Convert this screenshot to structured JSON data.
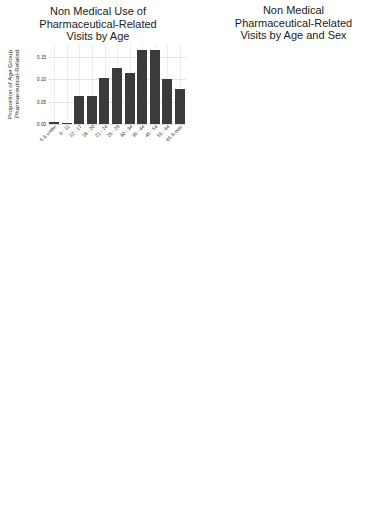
{
  "figure": {
    "age_categories": [
      "5 & under",
      "6 - 11",
      "12 - 17",
      "18 - 20",
      "21 - 24",
      "25 - 29",
      "30 - 34",
      "35 - 44",
      "45 - 54",
      "55 - 64",
      "65 & over"
    ],
    "xlabel": "age",
    "legend": {
      "title": "sex",
      "male": "male",
      "female": "female"
    }
  },
  "chart_data": [
    {
      "type": "bar",
      "panel": "top-left",
      "title": "Non Medical Use of Pharmaceutical-Related Visits by Age",
      "title_lines": [
        "Non Medical Use of",
        "Pharmaceutical-Related",
        "Visits by Age"
      ],
      "ylabel": "Proportion of Age Group Pharmaceutical-Related",
      "ylabel_lines": [
        "Proportion of Age Group",
        "Pharmaceutical-Related"
      ],
      "xlabel": "",
      "categories": [
        "5 & under",
        "6 - 11",
        "12 - 17",
        "18 - 20",
        "21 - 24",
        "25 - 29",
        "30 - 34",
        "35 - 44",
        "45 - 54",
        "55 - 64",
        "65 & over"
      ],
      "values": [
        0.005,
        0.002,
        0.063,
        0.063,
        0.103,
        0.124,
        0.113,
        0.165,
        0.165,
        0.1,
        0.078
      ],
      "yticks": [
        0.0,
        0.05,
        0.1,
        0.15
      ],
      "yticklabels": [
        "0.00",
        "0.05",
        "0.10",
        "0.15"
      ],
      "ylim": [
        0,
        0.178
      ],
      "grid": true
    },
    {
      "type": "line",
      "panel": "top-right",
      "title": "Non Medical Pharmaceutical-Related Visits by Age and Sex",
      "title_lines": [
        "Non Medical",
        "Pharmaceutical-Related",
        "Visits by Age and Sex"
      ],
      "ylabel": "Proportion of Sex Pharmaceutical-Related",
      "ylabel_lines": [
        "Proportion of Sex",
        "Pharmaceutical-Related"
      ],
      "xlabel": "age",
      "x": [
        "5 & under",
        "6 - 11",
        "12 - 17",
        "18 - 20",
        "21 - 24",
        "25 - 29",
        "30 - 34",
        "35 - 44",
        "45 - 54",
        "55 - 64",
        "65 & over"
      ],
      "series": [
        {
          "name": "male",
          "values": [
            0.0075,
            0.0062,
            0.03,
            0.036,
            0.044,
            0.062,
            0.053,
            0.076,
            0.077,
            0.052,
            0.044
          ]
        },
        {
          "name": "female",
          "values": [
            0.0075,
            0.0062,
            0.033,
            0.0268,
            0.04,
            0.048,
            0.049,
            0.076,
            0.077,
            0.052,
            0.031
          ]
        }
      ],
      "yticks": [
        0.0,
        0.025,
        0.05,
        0.075
      ],
      "yticklabels": [
        "0.000",
        "0.025",
        "0.050",
        "0.075"
      ],
      "ylim": [
        0,
        0.085
      ],
      "legend_position": "right",
      "grid": true
    },
    {
      "type": "bar",
      "panel": "middle-left",
      "title": "Antidepressant-Related Visits by Age",
      "title_lines": [
        "Antidepressant-Related",
        "Visits by Age"
      ],
      "ylabel": "Proportion of Age Group Antidepressant-Related",
      "ylabel_lines": [
        "Proportion of Age Group",
        "Antidepressant-Related"
      ],
      "xlabel": "",
      "categories": [
        "5 & under",
        "6 - 11",
        "12 - 17",
        "18 - 20",
        "21 - 24",
        "25 - 29",
        "30 - 34",
        "35 - 44",
        "45 - 54",
        "55 - 64",
        "65 & over"
      ],
      "values": [
        0.025,
        0.012,
        0.101,
        0.062,
        0.092,
        0.092,
        0.096,
        0.155,
        0.157,
        0.102,
        0.112
      ],
      "yticks": [
        0.0,
        0.05,
        0.1,
        0.15
      ],
      "yticklabels": [
        "0.00",
        "0.05",
        "0.10",
        "0.15"
      ],
      "ylim": [
        0,
        0.17
      ],
      "grid": true
    },
    {
      "type": "line",
      "panel": "middle-right",
      "title": "Antidepressant-Related Visits by Age and Sex",
      "title_lines": [
        "Antidepressant-Related",
        "Visits by Age and Sex"
      ],
      "ylabel": "Proportion of Sex Antidepressant-Related",
      "ylabel_lines": [
        "Proportion of Sex",
        "Antidepressant-Related"
      ],
      "xlabel": "age",
      "x": [
        "5 & under",
        "6 - 11",
        "12 - 17",
        "18 - 20",
        "21 - 24",
        "25 - 29",
        "30 - 34",
        "35 - 44",
        "45 - 54",
        "55 - 64",
        "65 & over"
      ],
      "series": [
        {
          "name": "male",
          "values": [
            0.013,
            0.0105,
            0.015,
            0.017,
            0.035,
            0.0275,
            0.029,
            0.04,
            0.0465,
            0.027,
            0.043
          ]
        },
        {
          "name": "female",
          "values": [
            0.013,
            0.006,
            0.08,
            0.0355,
            0.0525,
            0.06,
            0.0625,
            0.0635,
            0.1005,
            0.1,
            0.075
          ]
        }
      ],
      "yticks": [
        0.0,
        0.025,
        0.05,
        0.075,
        0.1
      ],
      "yticklabels": [
        "0.000",
        "0.025",
        "0.050",
        "0.075",
        "0.100"
      ],
      "ylim": [
        0,
        0.112
      ],
      "legend_position": "right",
      "grid": true
    },
    {
      "type": "bar",
      "panel": "bottom-left",
      "title": "Opiate-Related Visits by Age",
      "title_lines": [
        "Opiate-Related",
        "Visits by Age"
      ],
      "ylabel": "Proportion of Age Group Opiate-Related",
      "ylabel_lines": [
        "Proportion of Age Group",
        "Opiate-Related"
      ],
      "xlabel": "",
      "categories": [
        "5 & under",
        "6 - 11",
        "12 - 17",
        "18 - 20",
        "21 - 24",
        "25 - 29",
        "30 - 34",
        "35 - 44",
        "45 - 54",
        "55 - 64",
        "65 & over"
      ],
      "values": [
        0.01,
        0.005,
        0.017,
        0.047,
        0.11,
        0.12,
        0.11,
        0.154,
        0.159,
        0.12,
        0.146
      ],
      "yticks": [
        0.0,
        0.05,
        0.1,
        0.15
      ],
      "yticklabels": [
        "0.00",
        "0.05",
        "0.10",
        "0.15"
      ],
      "ylim": [
        0,
        0.172
      ],
      "grid": true
    },
    {
      "type": "line",
      "panel": "bottom-right",
      "title": "Opiate-Related Visits by Age and Sex",
      "title_lines": [
        "Opiate-Related Visits",
        "by Age and Sex"
      ],
      "ylabel": "Proportion of Sex Opiate-Related",
      "ylabel_lines": [
        "Proportion of Sex",
        "Opiate-Related"
      ],
      "xlabel": "age",
      "x": [
        "5 & under",
        "6 - 11",
        "12 - 17",
        "18 - 20",
        "21 - 24",
        "25 - 29",
        "30 - 34",
        "35 - 44",
        "45 - 54",
        "55 - 64",
        "65 & over"
      ],
      "series": [
        {
          "name": "male",
          "values": [
            0.0068,
            0.0055,
            0.0073,
            0.0225,
            0.0585,
            0.06,
            0.054,
            0.0755,
            0.076,
            0.06,
            0.0625
          ]
        },
        {
          "name": "female",
          "values": [
            0.0068,
            0.0035,
            0.0073,
            0.0225,
            0.052,
            0.06,
            0.054,
            0.0755,
            0.082,
            0.06,
            0.08
          ]
        }
      ],
      "yticks": [
        0.0,
        0.02,
        0.04,
        0.06,
        0.08
      ],
      "yticklabels": [
        "0.00",
        "0.02",
        "0.04",
        "0.06",
        "0.08"
      ],
      "ylim": [
        0,
        0.088
      ],
      "legend_position": "right",
      "grid": true
    }
  ]
}
